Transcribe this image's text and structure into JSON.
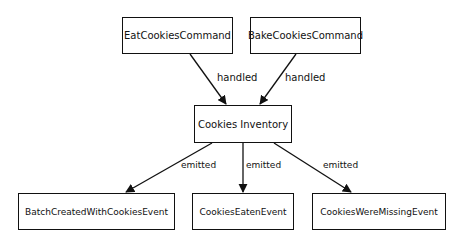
{
  "diagram": {
    "nodes": {
      "eat_command": "EatCookiesCommand",
      "bake_command": "BakeCookiesCommand",
      "inventory": "Cookies Inventory",
      "batch_event": "BatchCreatedWithCookiesEvent",
      "eaten_event": "CookiesEatenEvent",
      "missing_event": "CookiesWereMissingEvent"
    },
    "edges": [
      {
        "from": "EatCookiesCommand",
        "to": "Cookies Inventory",
        "label": "handled"
      },
      {
        "from": "BakeCookiesCommand",
        "to": "Cookies Inventory",
        "label": "handled"
      },
      {
        "from": "Cookies Inventory",
        "to": "BatchCreatedWithCookiesEvent",
        "label": "emitted"
      },
      {
        "from": "Cookies Inventory",
        "to": "CookiesEatenEvent",
        "label": "emitted"
      },
      {
        "from": "Cookies Inventory",
        "to": "CookiesWereMissingEvent",
        "label": "emitted"
      }
    ]
  }
}
